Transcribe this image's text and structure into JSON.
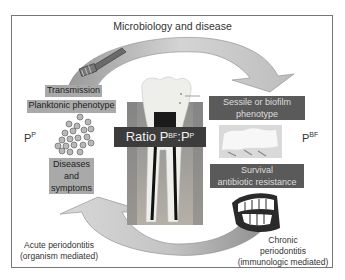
{
  "title": "Microbiology and disease",
  "labels": {
    "transmission": "Transmission",
    "planktonic": "Planktonic phenotype",
    "sessile": "Sessile or biofilm phenotype",
    "sessile_line1": "Sessile or biofilm",
    "sessile_line2": "phenotype",
    "survival_line1": "Survival",
    "survival_line2": "antibiotic resistance",
    "diseases_line1": "Diseases",
    "diseases_line2": "and",
    "diseases_line3": "symptoms",
    "ratio_prefix": "Ratio P",
    "ratio_sup1": "BF",
    "ratio_mid": ":P",
    "ratio_sup2": "P",
    "pp_base": "P",
    "pp_sup": "P",
    "pbf_base": "P",
    "pbf_sup": "BF"
  },
  "captions": {
    "acute_line1": "Acute periodontitis",
    "acute_line2": "(organism mediated)",
    "chronic_line1": "Chronic",
    "chronic_line2": "periodontitis",
    "chronic_line3": "(immunologic mediated)"
  },
  "colors": {
    "light_box": "#a9a9a9",
    "dark_box": "#5a5a5a",
    "ratio_box": "#3c3c3c",
    "arrow_fill": "#c8c8c8",
    "frame": "#777777"
  },
  "icons": [
    "toothbrush-icon",
    "bacteria-cluster-icon",
    "tooth-cross-section-image",
    "biofilm-micrograph-image",
    "teeth-jaw-icon"
  ]
}
